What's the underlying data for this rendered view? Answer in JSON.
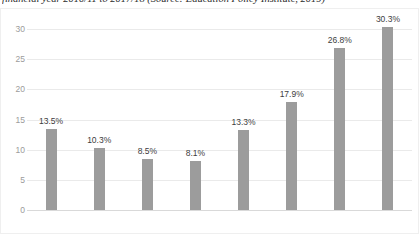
{
  "caption": {
    "text": "financial year 2010/11 to 2017/18 (Source: Education Policy Institute, 2019)"
  },
  "chart_data": {
    "type": "bar",
    "title": "",
    "subtitle": "",
    "xlabel": "",
    "ylabel": "",
    "categories": [
      "2011",
      "2012",
      "2013",
      "2014",
      "2015",
      "2016",
      "2017",
      "2018"
    ],
    "values": [
      13.5,
      10.3,
      8.5,
      8.1,
      13.3,
      17.9,
      26.8,
      30.3
    ],
    "data_labels": [
      "13.5%",
      "10.3%",
      "8.5%",
      "8.1%",
      "13.3%",
      "17.9%",
      "26.8%",
      "30.3%"
    ],
    "ylim": [
      0,
      30
    ],
    "yticks": [
      0,
      5,
      10,
      15,
      20,
      25,
      30
    ],
    "ytick_labels": [
      "0",
      "5",
      "10",
      "15",
      "20",
      "25",
      "30"
    ],
    "grid": true,
    "grid_axis": "y",
    "legend": false,
    "legend_position": "none",
    "bar_color": "#9c9c9c",
    "gridline_color": "#eaeaea",
    "tick_label_color": "#9b9b9b",
    "data_label_color": "#3d3d3d"
  }
}
